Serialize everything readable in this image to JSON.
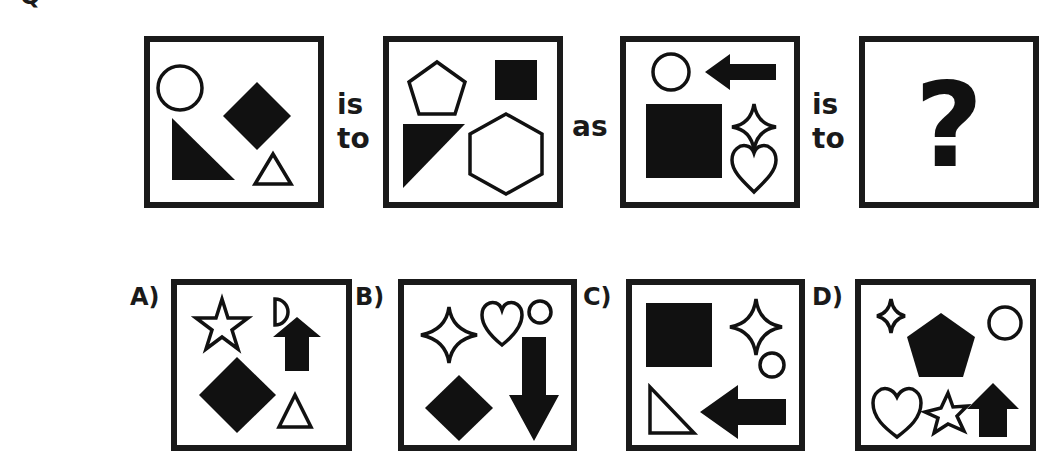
{
  "question": {
    "label_fragment": "Q",
    "connectors": {
      "is_to_1": [
        "is",
        "to"
      ],
      "as": "as",
      "is_to_2": [
        "is",
        "to"
      ]
    },
    "unknown": "?",
    "panels": [
      {
        "id": "panel-1",
        "shapes": [
          "circle-outline",
          "diamond-filled",
          "right-triangle-filled",
          "triangle-outline"
        ]
      },
      {
        "id": "panel-2",
        "shapes": [
          "pentagon-outline",
          "square-filled",
          "right-triangle-filled",
          "hexagon-outline"
        ]
      },
      {
        "id": "panel-3",
        "shapes": [
          "circle-outline",
          "arrow-left-filled",
          "square-filled",
          "four-point-star-outline",
          "heart-outline"
        ]
      },
      {
        "id": "panel-4",
        "shapes": [
          "question-mark"
        ]
      }
    ]
  },
  "options": [
    {
      "label": "A)",
      "shapes": [
        "star-outline",
        "half-circle-outline",
        "arrow-up-filled",
        "diamond-filled",
        "triangle-outline"
      ]
    },
    {
      "label": "B)",
      "shapes": [
        "four-point-star-outline",
        "heart-outline",
        "circle-outline",
        "diamond-filled",
        "arrow-down-filled"
      ]
    },
    {
      "label": "C)",
      "shapes": [
        "square-filled",
        "four-point-star-outline",
        "circle-outline",
        "right-triangle-outline",
        "arrow-left-filled"
      ]
    },
    {
      "label": "D)",
      "shapes": [
        "four-point-star-outline",
        "pentagon-filled",
        "circle-outline",
        "heart-outline",
        "star-outline",
        "arrow-up-filled"
      ]
    }
  ],
  "colors": {
    "ink": "#1a1a1a",
    "background": "#ffffff"
  }
}
